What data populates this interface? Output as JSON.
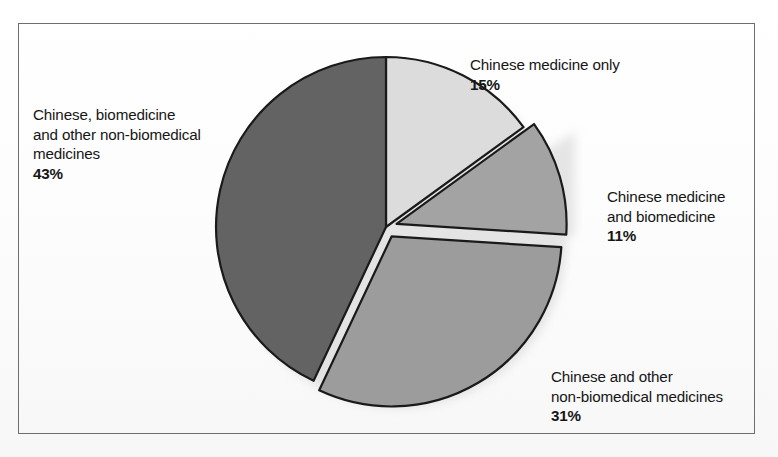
{
  "figure": {
    "width": 778,
    "height": 457,
    "background_color": "#ffffff",
    "frame_color": "#6e6e6e",
    "text_color": "#161616"
  },
  "chart_data": {
    "type": "pie",
    "title": "",
    "subtitle": "",
    "xlabel": "",
    "ylabel": "",
    "legend_position": "none",
    "grid": false,
    "units": "percent",
    "start_angle_deg": 0,
    "direction": "clockwise",
    "categories": [
      "Chinese medicine only",
      "Chinese medicine and biomedicine",
      "Chinese and other non-biomedical medicines",
      "Chinese, biomedicine and other non-biomedical medicines"
    ],
    "values": [
      15,
      11,
      31,
      43
    ],
    "value_labels": [
      "15%",
      "11%",
      "31%",
      "43%"
    ],
    "colors": [
      "#dcdcdc",
      "#a3a3a3",
      "#9c9c9c",
      "#636363"
    ],
    "exploded": [
      false,
      true,
      true,
      false
    ],
    "total": 100
  },
  "slices": [
    {
      "name": "chinese-medicine-only",
      "label_lines": "Chinese medicine only",
      "percent_label": "15%",
      "value": 15,
      "color": "#dcdcdc",
      "exploded": false
    },
    {
      "name": "chinese-medicine-and-biomedicine",
      "label_lines": "Chinese medicine\nand biomedicine",
      "percent_label": "11%",
      "value": 11,
      "color": "#a3a3a3",
      "exploded": true
    },
    {
      "name": "chinese-and-other-non-biomedical-medicines",
      "label_lines": "Chinese and other\nnon-biomedical medicines",
      "percent_label": "31%",
      "value": 31,
      "color": "#9c9c9c",
      "exploded": true
    },
    {
      "name": "chinese-biomedicine-and-other-non-biomedical-medicines",
      "label_lines": "Chinese, biomedicine\nand other non-biomedical\nmedicines",
      "percent_label": "43%",
      "value": 43,
      "color": "#636363",
      "exploded": false
    }
  ]
}
